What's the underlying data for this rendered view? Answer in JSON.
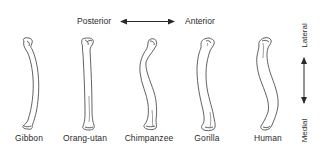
{
  "figure": {
    "orientation_horizontal": {
      "left_label": "Posterior",
      "right_label": "Anterior"
    },
    "orientation_vertical": {
      "top_label": "Lateral",
      "bottom_label": "Medial"
    },
    "specimens": [
      {
        "name": "Gibbon",
        "center_x": 29
      },
      {
        "name": "Orang-utan",
        "center_x": 85
      },
      {
        "name": "Chimpanzee",
        "center_x": 149
      },
      {
        "name": "Gorilla",
        "center_x": 207
      },
      {
        "name": "Human",
        "center_x": 268
      }
    ],
    "colors": {
      "line": "#3a3a3a",
      "background": "#ffffff",
      "text": "#2a2a2a"
    }
  }
}
